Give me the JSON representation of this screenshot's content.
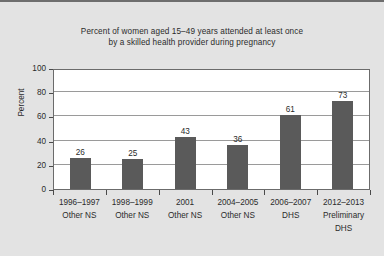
{
  "chart_data": {
    "type": "bar",
    "title": "Percent of women aged 15–49 years attended at least once by a skilled health provider during pregnancy",
    "title_lines": [
      "Percent of women aged 15–49 years attended at least once",
      "by a skilled health provider during pregnancy"
    ],
    "categories": [
      "1996–1997 Other NS",
      "1998–1999 Other NS",
      "2001 Other NS",
      "2004–2005 Other NS",
      "2006–2007 DHS",
      "2012–2013 Preliminary DHS"
    ],
    "category_lines": [
      [
        "1996–1997",
        "Other NS"
      ],
      [
        "1998–1999",
        "Other NS"
      ],
      [
        "2001",
        "Other NS"
      ],
      [
        "2004–2005",
        "Other NS"
      ],
      [
        "2006–2007",
        "DHS"
      ],
      [
        "2012–2013",
        "Preliminary",
        "DHS"
      ]
    ],
    "values": [
      26,
      25,
      43,
      36,
      61,
      73
    ],
    "xlabel": "",
    "ylabel": "Percent",
    "ylim": [
      0,
      100
    ],
    "yticks": [
      0,
      20,
      40,
      60,
      80,
      100
    ],
    "ytick_labels": [
      "0",
      "20",
      "40",
      "60",
      "80",
      "100"
    ],
    "grid": true,
    "legend": false,
    "bar_color": "#5a5a5a",
    "plot_background": "#ffffff",
    "figure_background": "#e3e3e3",
    "gridline_color": "#9a9a9a",
    "axis_color": "#6b6b6b",
    "text_color": "#2b2b2b"
  }
}
